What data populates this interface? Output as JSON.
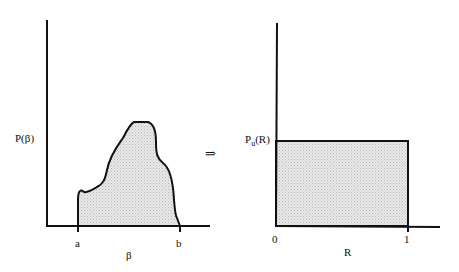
{
  "left_plot": {
    "y_label": "P(β)",
    "x_label": "β",
    "tick_a": "a",
    "tick_b": "b"
  },
  "arrow": "⇒",
  "right_plot": {
    "y_label_main": "P",
    "y_label_sub": "u",
    "y_label_tail": "(R)",
    "x_label": "R",
    "tick_0": "0",
    "tick_1": "1"
  },
  "colors": {
    "fill": "#dcdcdc",
    "stroke": "#111111"
  }
}
